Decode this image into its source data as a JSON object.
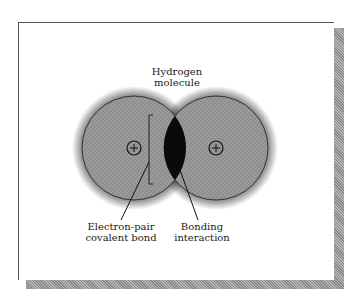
{
  "figure": {
    "title_line1": "Hydrogen",
    "title_line2": "molecule",
    "labels": {
      "electron_pair_line1": "Electron-pair",
      "electron_pair_line2": "covalent bond",
      "bonding_line1": "Bonding",
      "bonding_line2": "interaction"
    },
    "nucleus_symbol": "+",
    "colors": {
      "atom_fill": "#8c8c8c",
      "overlap_fill": "#0a0a0a",
      "dots": "#222222",
      "shadow": "#9a9a9a"
    }
  }
}
